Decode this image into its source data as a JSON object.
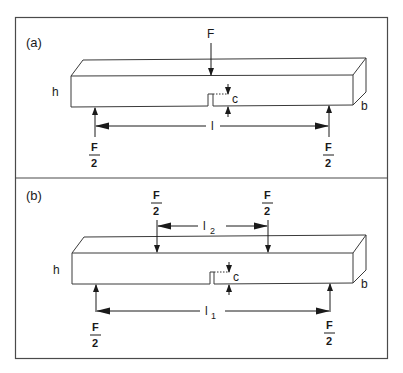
{
  "figure": {
    "panels": [
      {
        "id": "a",
        "label": "(a)",
        "test": "three-point bending",
        "load_top": "F",
        "support_left": {
          "num": "F",
          "den": "2"
        },
        "support_right": {
          "num": "F",
          "den": "2"
        },
        "height_label": "h",
        "width_label": "b",
        "notch_label": "c",
        "span_label": "l"
      },
      {
        "id": "b",
        "label": "(b)",
        "test": "four-point bending",
        "load_left": {
          "num": "F",
          "den": "2"
        },
        "load_right": {
          "num": "F",
          "den": "2"
        },
        "inner_span_label": "l",
        "inner_span_sub": "2",
        "support_left": {
          "num": "F",
          "den": "2"
        },
        "support_right": {
          "num": "F",
          "den": "2"
        },
        "height_label": "h",
        "width_label": "b",
        "notch_label": "c",
        "outer_span_label": "l",
        "outer_span_sub": "1"
      }
    ],
    "colors": {
      "line": "#1a1a1a",
      "frame": "#4a4a4a",
      "background": "#ffffff"
    }
  }
}
